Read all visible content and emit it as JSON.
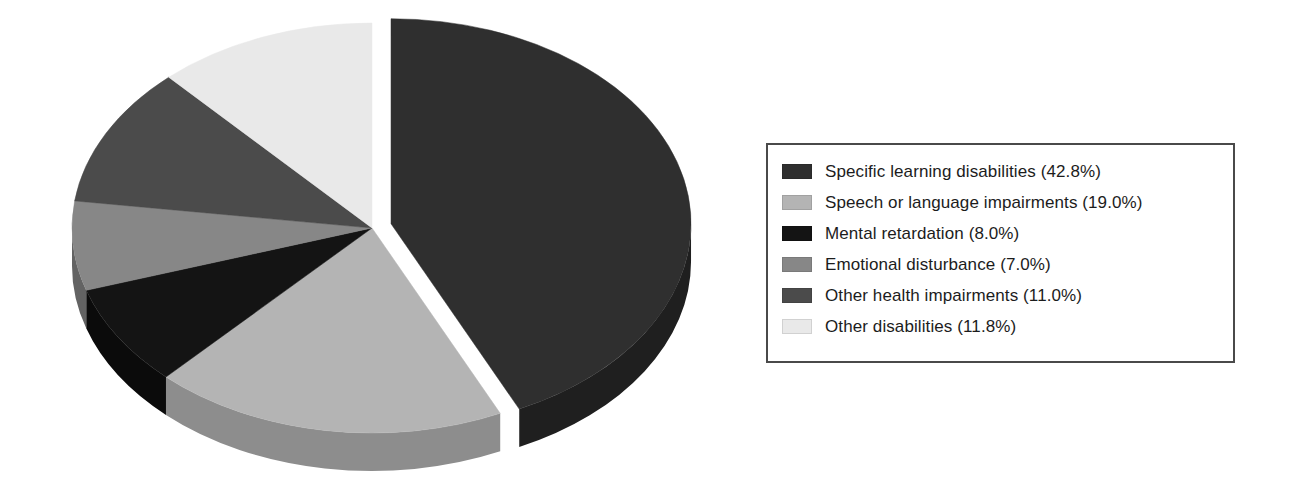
{
  "chart_data": {
    "type": "pie",
    "title": "",
    "subtitle": "",
    "xlabel": "",
    "ylabel": "",
    "style": "3d-exploded",
    "start_angle_deg": 0,
    "direction": "clockwise",
    "legend_position": "right",
    "grid": false,
    "categories": [
      "Specific learning disabilities",
      "Speech or language impairments",
      "Mental retardation",
      "Emotional disturbance",
      "Other health impairments",
      "Other disabilities"
    ],
    "values": [
      42.8,
      19.0,
      8.0,
      7.0,
      11.0,
      11.8
    ],
    "value_unit": "%",
    "colors": [
      "#2f2f2f",
      "#b4b4b4",
      "#141414",
      "#878787",
      "#4b4b4b",
      "#e9e9e9"
    ],
    "side_colors": [
      "#1f1f1f",
      "#8d8d8d",
      "#0b0b0b",
      "#636363",
      "#3a3a3a",
      "#bdbdbd"
    ],
    "exploded_slice": "Specific learning disabilities",
    "slices": [
      {
        "label": "Specific learning disabilities",
        "value": 42.8,
        "display": "Specific learning disabilities (42.8%)",
        "color": "#2f2f2f"
      },
      {
        "label": "Speech or language impairments",
        "value": 19.0,
        "display": "Speech or language impairments (19.0%)",
        "color": "#b4b4b4"
      },
      {
        "label": "Mental retardation",
        "value": 8.0,
        "display": "Mental retardation (8.0%)",
        "color": "#141414"
      },
      {
        "label": "Emotional disturbance",
        "value": 7.0,
        "display": "Emotional disturbance (7.0%)",
        "color": "#878787"
      },
      {
        "label": "Other health impairments",
        "value": 11.0,
        "display": "Other health impairments (11.0%)",
        "color": "#4b4b4b"
      },
      {
        "label": "Other disabilities",
        "value": 11.8,
        "display": "Other disabilities (11.8%)",
        "color": "#e9e9e9"
      }
    ]
  },
  "legend": {
    "border_color": "#4a4a4a",
    "items": [
      {
        "label": "Specific learning disabilities (42.8%)",
        "color": "#2f2f2f",
        "name": "specific-learning-disabilities"
      },
      {
        "label": "Speech or language impairments (19.0%)",
        "color": "#b4b4b4",
        "name": "speech-or-language-impairments"
      },
      {
        "label": "Mental retardation (8.0%)",
        "color": "#141414",
        "name": "mental-retardation"
      },
      {
        "label": "Emotional disturbance (7.0%)",
        "color": "#878787",
        "name": "emotional-disturbance"
      },
      {
        "label": "Other health impairments (11.0%)",
        "color": "#4b4b4b",
        "name": "other-health-impairments"
      },
      {
        "label": "Other disabilities (11.8%)",
        "color": "#e9e9e9",
        "name": "other-disabilities"
      }
    ]
  }
}
